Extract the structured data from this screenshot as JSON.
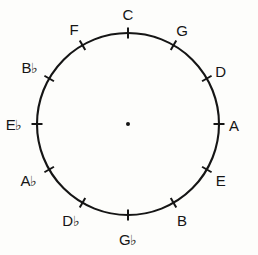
{
  "diagram": {
    "type": "circle-of-fifths",
    "background_color": "#fdfdfb",
    "stroke_color": "#151515",
    "center": {
      "x": 128,
      "y": 124
    },
    "radius": 91,
    "center_dot": {
      "visible": true,
      "radius": 2.0
    },
    "tick": {
      "length": 11,
      "width": 2
    },
    "notes": [
      {
        "id": "c",
        "label": "C",
        "letter": "C",
        "accidental": "",
        "angle_deg": 0,
        "label_radius": 110,
        "label_dx": 0,
        "label_dy": 0
      },
      {
        "id": "g",
        "label": "G",
        "letter": "G",
        "accidental": "",
        "angle_deg": 30,
        "label_radius": 108,
        "label_dx": 0,
        "label_dy": 0
      },
      {
        "id": "d",
        "label": "D",
        "letter": "D",
        "accidental": "",
        "angle_deg": 60,
        "label_radius": 107,
        "label_dx": 0,
        "label_dy": 0
      },
      {
        "id": "a",
        "label": "A",
        "letter": "A",
        "accidental": "",
        "angle_deg": 90,
        "label_radius": 106,
        "label_dx": 0,
        "label_dy": 1
      },
      {
        "id": "e",
        "label": "E",
        "letter": "E",
        "accidental": "",
        "angle_deg": 120,
        "label_radius": 107,
        "label_dx": 0,
        "label_dy": 2
      },
      {
        "id": "b",
        "label": "B",
        "letter": "B",
        "accidental": "",
        "angle_deg": 150,
        "label_radius": 108,
        "label_dx": 0,
        "label_dy": 2
      },
      {
        "id": "g-flat",
        "label": "G♭",
        "letter": "G",
        "accidental": "♭",
        "angle_deg": 180,
        "label_radius": 112,
        "label_dx": 0,
        "label_dy": 4
      },
      {
        "id": "d-flat",
        "label": "D♭",
        "letter": "D",
        "accidental": "♭",
        "angle_deg": 210,
        "label_radius": 110,
        "label_dx": -2,
        "label_dy": 2
      },
      {
        "id": "a-flat",
        "label": "A♭",
        "letter": "A",
        "accidental": "♭",
        "angle_deg": 240,
        "label_radius": 110,
        "label_dx": -4,
        "label_dy": 2
      },
      {
        "id": "e-flat",
        "label": "E♭",
        "letter": "E",
        "accidental": "♭",
        "angle_deg": 270,
        "label_radius": 110,
        "label_dx": -4,
        "label_dy": 1
      },
      {
        "id": "b-flat",
        "label": "B♭",
        "letter": "B",
        "accidental": "♭",
        "angle_deg": 300,
        "label_radius": 110,
        "label_dx": -3,
        "label_dy": -1
      },
      {
        "id": "f",
        "label": "F",
        "letter": "F",
        "accidental": "",
        "angle_deg": 330,
        "label_radius": 108,
        "label_dx": 0,
        "label_dy": -1
      }
    ]
  }
}
